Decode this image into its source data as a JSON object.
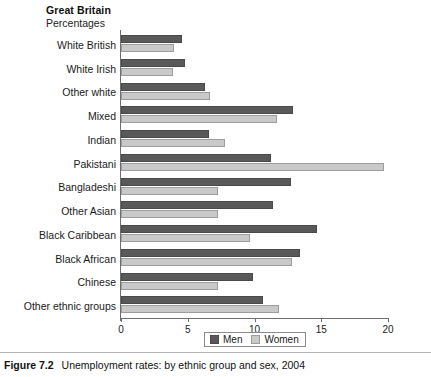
{
  "header": {
    "region": "Great Britain",
    "units": "Percentages"
  },
  "caption": {
    "figure_number": "Figure 7.2",
    "text": "Unemployment rates: by ethnic group and sex, 2004"
  },
  "legend": {
    "men_label": "Men",
    "women_label": "Women",
    "men_color": "#595959",
    "women_color": "#c9c9c9",
    "position": "bottom-center"
  },
  "chart_data": {
    "type": "bar",
    "orientation": "horizontal",
    "title": "Unemployment rates: by ethnic group and sex, 2004",
    "subtitle": "Great Britain",
    "xlabel": "Percentages",
    "ylabel": "",
    "xlim": [
      0,
      20
    ],
    "xticks": [
      0,
      5,
      10,
      15,
      20
    ],
    "xtick_labels": [
      "0",
      "5",
      "10",
      "15",
      "20"
    ],
    "grid": false,
    "categories": [
      "White British",
      "White Irish",
      "Other white",
      "Mixed",
      "Indian",
      "Pakistani",
      "Bangladeshi",
      "Other Asian",
      "Black Caribbean",
      "Black African",
      "Chinese",
      "Other ethnic groups"
    ],
    "series": [
      {
        "name": "Men",
        "color": "#595959",
        "values": [
          4.6,
          4.8,
          6.3,
          12.9,
          6.6,
          11.2,
          12.7,
          11.4,
          14.7,
          13.4,
          9.9,
          10.6
        ]
      },
      {
        "name": "Women",
        "color": "#c9c9c9",
        "values": [
          4.0,
          3.9,
          6.7,
          11.7,
          7.8,
          19.7,
          7.3,
          7.3,
          9.7,
          12.8,
          7.3,
          11.8
        ]
      }
    ]
  }
}
